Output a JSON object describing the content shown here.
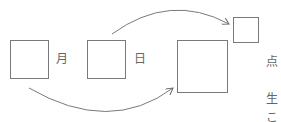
{
  "diagram": {
    "boxes": [
      {
        "id": "month-box",
        "x": 10,
        "y": 40,
        "w": 39,
        "h": 39
      },
      {
        "id": "day-box",
        "x": 87,
        "y": 40,
        "w": 39,
        "h": 39
      },
      {
        "id": "large-target-box",
        "x": 177,
        "y": 40,
        "w": 51,
        "h": 53
      },
      {
        "id": "small-target-box",
        "x": 233,
        "y": 17,
        "w": 26,
        "h": 26
      }
    ],
    "labels": {
      "month": "月",
      "day": "日",
      "side_1": "点",
      "side_2": "生",
      "side_3": "こ"
    },
    "arrows": [
      {
        "from": "day-box",
        "to": "small-target-box"
      },
      {
        "from": "month-box",
        "to": "large-target-box"
      }
    ],
    "colors": {
      "stroke": "#7a7a7a",
      "text": "#666666"
    }
  }
}
